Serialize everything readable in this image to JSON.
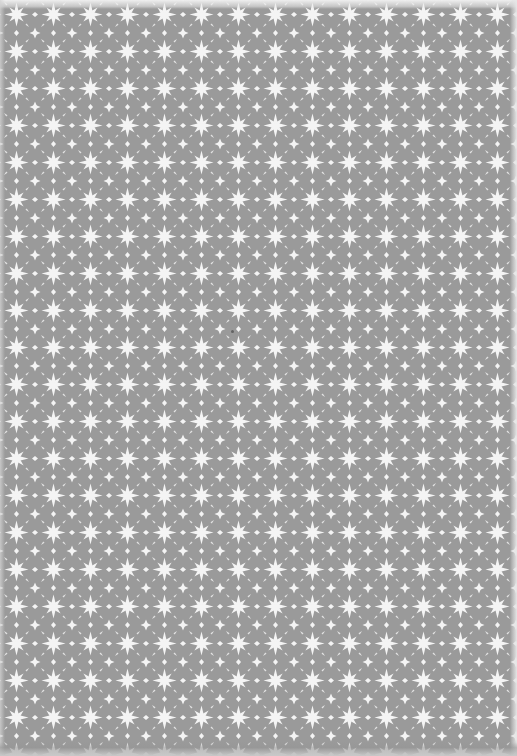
{
  "image": {
    "description": "Grey sheet of patterned paper with repeating white eight-point star and diamond-cross lattice motif",
    "width": 517,
    "height": 756,
    "background_color": "#9a9a9a",
    "motif_color": "#f4f4f4",
    "pattern": {
      "type": "repeating-lattice",
      "tile_size_px": 37,
      "columns_approx": 14,
      "rows_approx": 20,
      "primary_motif": "eight-point-star",
      "secondary_motif": "four-point-diamond-cross"
    },
    "edges": {
      "top": "light border strip",
      "right": "light border strip",
      "bottom": "soft grey shading"
    },
    "blemish": {
      "x": 232,
      "y": 331,
      "color": "#555555"
    }
  }
}
